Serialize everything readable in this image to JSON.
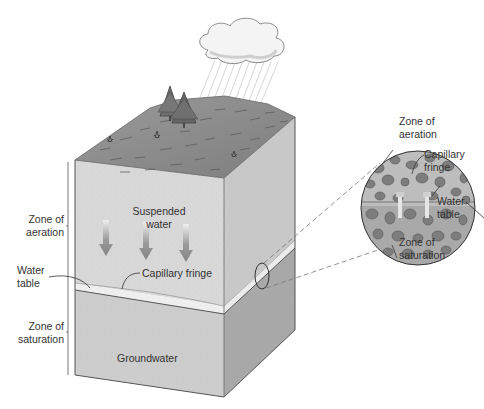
{
  "block_labels": {
    "suspended_water_1": "Suspended",
    "suspended_water_2": "water",
    "capillary_fringe": "Capillary fringe",
    "groundwater": "Groundwater"
  },
  "side_labels": {
    "zone_of_aeration_1": "Zone of",
    "zone_of_aeration_2": "aeration",
    "water_table_1": "Water",
    "water_table_2": "table",
    "zone_of_saturation_1": "Zone of",
    "zone_of_saturation_2": "saturation"
  },
  "inset_labels": {
    "zone_of_aeration_1": "Zone of",
    "zone_of_aeration_2": "aeration",
    "capillary_fringe_1": "Capillary",
    "capillary_fringe_2": "fringe",
    "water_table_1": "Water",
    "water_table_2": "table",
    "zone_of_saturation_1": "Zone of",
    "zone_of_saturation_2": "saturation"
  },
  "colors": {
    "soil_front": "#d6d6d6",
    "soil_side": "#bdbdbd",
    "saturated_front": "#cfcfcf",
    "saturated_side": "#ababab",
    "surface": "#8c8c8c",
    "capillary_band": "#eeeeee",
    "grain": "#7a7a7a",
    "arrow": "#8a8a8a",
    "text": "#333333"
  }
}
